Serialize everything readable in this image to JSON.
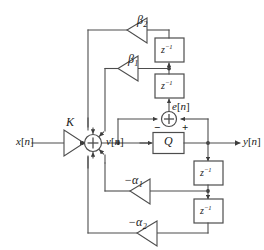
{
  "figure": {
    "type": "block-diagram",
    "background_color": "#ffffff",
    "line_color": "#4d4d4d",
    "text_color": "#1a1a1a"
  },
  "signals": {
    "input": "x[n]",
    "input_base": "x",
    "node_v": "v[n]",
    "node_v_base": "v",
    "error": "e[n]",
    "error_base": "e",
    "output": "y[n]",
    "output_base": "y",
    "index": "n"
  },
  "gains": [
    {
      "id": "gain-k",
      "label": "K",
      "base": "K",
      "subscript": "",
      "direction": "right"
    },
    {
      "id": "gain-beta2",
      "label": "β2",
      "base": "β",
      "subscript": "2",
      "direction": "left"
    },
    {
      "id": "gain-beta1",
      "label": "β1",
      "base": "β",
      "subscript": "1",
      "direction": "left"
    },
    {
      "id": "gain-alpha1",
      "label": "−α1",
      "base": "−α",
      "subscript": "1",
      "direction": "left"
    },
    {
      "id": "gain-alpha2",
      "label": "−α2",
      "base": "−α",
      "subscript": "2",
      "direction": "left"
    }
  ],
  "blocks": {
    "quantizer_label": "Q",
    "delay_label": "z",
    "delay_exponent": "−1",
    "delay_label_full": "z⁻¹",
    "delays": [
      {
        "id": "delay-top",
        "label": "z⁻¹"
      },
      {
        "id": "delay-second",
        "label": "z⁻¹"
      },
      {
        "id": "delay-output-first",
        "label": "z⁻¹"
      },
      {
        "id": "delay-output-second",
        "label": "z⁻¹"
      }
    ]
  },
  "adders": {
    "main": {
      "id": "main-adder",
      "symbol": "+",
      "inputs": 5
    },
    "error": {
      "id": "error-adder",
      "symbol": "+",
      "minus_sign": "−",
      "plus_sign": "+"
    }
  }
}
